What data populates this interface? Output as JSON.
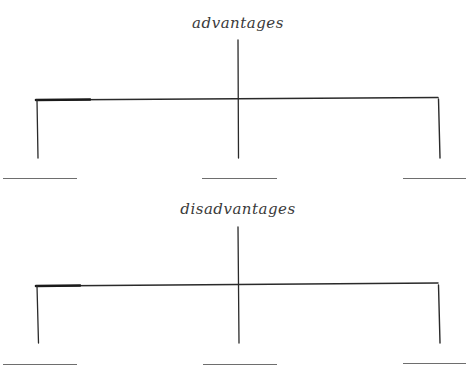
{
  "diagram": {
    "cropped_header_fragment": "",
    "sections": [
      {
        "title": "advantages",
        "branches": [
          {
            "position": "left",
            "blank_answer": ""
          },
          {
            "position": "center",
            "blank_answer": ""
          },
          {
            "position": "right",
            "blank_answer": ""
          }
        ]
      },
      {
        "title": "disadvantages",
        "branches": [
          {
            "position": "left",
            "blank_answer": ""
          },
          {
            "position": "center",
            "blank_answer": ""
          },
          {
            "position": "right",
            "blank_answer": ""
          }
        ]
      }
    ],
    "colors": {
      "ink": "#2a2a2a",
      "blank_line": "#6e6e6e",
      "background": "#ffffff"
    }
  }
}
